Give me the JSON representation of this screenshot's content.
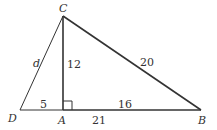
{
  "diagram": {
    "type": "geometry",
    "vertices": {
      "C": "C",
      "D": "D",
      "A": "A",
      "B": "B"
    },
    "segment_labels": {
      "DC": "d",
      "CA": "12",
      "CB": "20",
      "DA": "5",
      "AB_inner": "16",
      "AB_total": "21"
    },
    "right_angle_at": "A",
    "colors": {
      "line": "#333333",
      "background": "#ffffff"
    }
  }
}
